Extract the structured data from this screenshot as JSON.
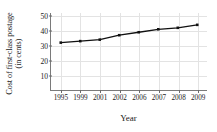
{
  "chart_data": {
    "type": "line",
    "title": "",
    "xlabel": "Year",
    "ylabel_line1": "Cost of first-class postage",
    "ylabel_line2": "(in cents)",
    "categories": [
      "1995",
      "1999",
      "2001",
      "2002",
      "2006",
      "2007",
      "2008",
      "2009"
    ],
    "values": [
      32,
      33,
      34,
      37,
      39,
      41,
      42,
      44
    ],
    "yticks": [
      10,
      20,
      30,
      40,
      50
    ],
    "ylim": [
      0,
      52
    ],
    "grid": true,
    "legend": "none",
    "marker": "square",
    "series_color": "#111111",
    "grid_color": "#e3e3e3",
    "axis_color": "#7a7a7a"
  }
}
